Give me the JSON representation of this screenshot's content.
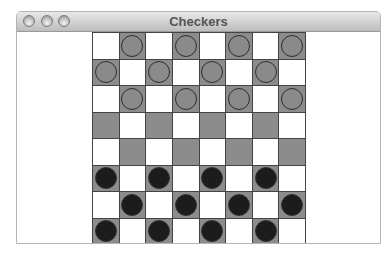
{
  "window": {
    "title": "Checkers",
    "buttons": [
      "close",
      "minimize",
      "zoom"
    ]
  },
  "colors": {
    "light_square": "#ffffff",
    "dark_square": "#8c8c8c",
    "light_piece": "#8a8a8a",
    "dark_piece": "#1c1c1c"
  },
  "board": {
    "size": 8,
    "rows": [
      [
        "",
        "L",
        "",
        "L",
        "",
        "L",
        "",
        "L"
      ],
      [
        "L",
        "",
        "L",
        "",
        "L",
        "",
        "L",
        ""
      ],
      [
        "",
        "L",
        "",
        "L",
        "",
        "L",
        "",
        "L"
      ],
      [
        "",
        "",
        "",
        "",
        "",
        "",
        "",
        ""
      ],
      [
        "",
        "",
        "",
        "",
        "",
        "",
        "",
        ""
      ],
      [
        "D",
        "",
        "D",
        "",
        "D",
        "",
        "D",
        ""
      ],
      [
        "",
        "D",
        "",
        "D",
        "",
        "D",
        "",
        "D"
      ],
      [
        "D",
        "",
        "D",
        "",
        "D",
        "",
        "D",
        ""
      ]
    ],
    "dark_square_parity": "odd-on-even-rows"
  }
}
